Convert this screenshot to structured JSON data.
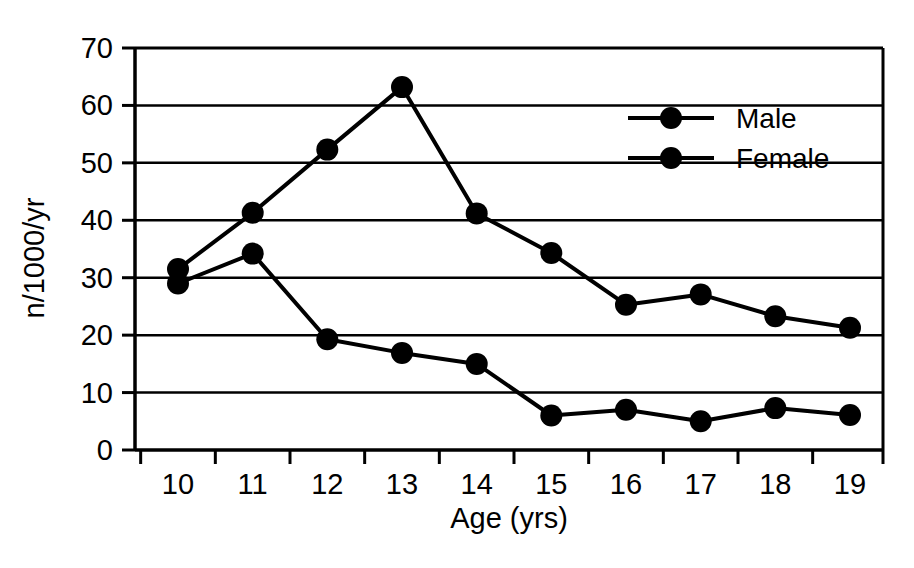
{
  "chart_data": {
    "type": "line",
    "title": "",
    "xlabel": "Age (yrs)",
    "ylabel": "n/1000/yr",
    "categories": [
      10,
      11,
      12,
      13,
      14,
      15,
      16,
      17,
      18,
      19
    ],
    "xticklabels": [
      "10",
      "11",
      "12",
      "13",
      "14",
      "15",
      "16",
      "17",
      "18",
      "19"
    ],
    "yticklabels": [
      "0",
      "10",
      "20",
      "30",
      "40",
      "50",
      "60",
      "70"
    ],
    "yticks": [
      0,
      10,
      20,
      30,
      40,
      50,
      60,
      70
    ],
    "ylim": [
      0,
      70
    ],
    "grid": "horizontal",
    "legend_position": "upper-right",
    "series": [
      {
        "name": "Male",
        "marker": "filled-circle",
        "color": "#000000",
        "values": [
          31.5,
          41.3,
          52.3,
          63.2,
          41.2,
          34.3,
          25.3,
          27.1,
          23.3,
          21.3
        ]
      },
      {
        "name": "Female",
        "marker": "filled-circle",
        "color": "#000000",
        "values": [
          29.0,
          34.2,
          19.3,
          16.9,
          15.0,
          6.0,
          7.0,
          5.0,
          7.3,
          6.1
        ]
      }
    ]
  },
  "legend": {
    "items": [
      {
        "label": "Male"
      },
      {
        "label": "Female"
      }
    ]
  },
  "colors": {
    "line": "#000000",
    "marker": "#000000",
    "grid": "#000000",
    "axis": "#000000",
    "background": "#ffffff"
  }
}
